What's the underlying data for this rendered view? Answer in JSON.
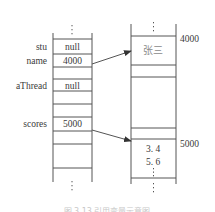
{
  "diagram": {
    "type": "memory-reference-diagram",
    "stack": {
      "rows": [
        {
          "label": "stu",
          "value": "null"
        },
        {
          "label": "name",
          "value": "4000"
        },
        {
          "label": "",
          "value": ""
        },
        {
          "label": "aThread",
          "value": "null"
        },
        {
          "label": "",
          "value": ""
        },
        {
          "label": "",
          "value": ""
        },
        {
          "label": "scores",
          "value": "5000"
        },
        {
          "label": "",
          "value": ""
        },
        {
          "label": "",
          "value": ""
        }
      ],
      "ellipsis": "⋮"
    },
    "heap": {
      "blocks": [
        {
          "address": "4000",
          "contents": "张三"
        },
        {
          "address": "5000",
          "contents": [
            "3. 4",
            "5. 6",
            "⋮"
          ]
        }
      ],
      "ellipsis": "⋮"
    },
    "arrows": [
      {
        "from": "name",
        "to": "4000"
      },
      {
        "from": "scores",
        "to": "5000"
      }
    ],
    "caption": "图 3.13  引用变量示意图",
    "colors": {
      "line": "#555555",
      "text": "#3a3a3a",
      "cjk_text": "#8a8a8a"
    }
  }
}
